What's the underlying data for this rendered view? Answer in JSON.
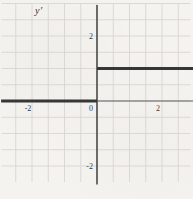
{
  "figure": {
    "axis_label": "y′",
    "description_visible_elements": "coordinate grid with x-axis, y-axis, and a thick step-function curve"
  },
  "colors": {
    "background": "#f5f3ef",
    "grid": "#d4d2ce",
    "axis": "#5f5f5f",
    "curve": "#363636",
    "tick_text": "#3a3a3a"
  },
  "chart_data": {
    "type": "line",
    "subtype": "step-function",
    "title": "",
    "xlabel": "",
    "ylabel": "y′",
    "xlim": [
      -3,
      3
    ],
    "ylim": [
      -2.5,
      3
    ],
    "grid": true,
    "grid_step": 0.5,
    "x_ticks": [
      {
        "value": -2,
        "label": "-2"
      },
      {
        "value": 0,
        "label": "0"
      },
      {
        "value": 2,
        "label": "2"
      }
    ],
    "y_ticks": [
      {
        "value": 2,
        "label": "2"
      },
      {
        "value": -2,
        "label": "-2"
      }
    ],
    "series": [
      {
        "name": "y-prime step function",
        "color": "#363636",
        "segments": [
          {
            "from": [
              -2.95,
              0
            ],
            "to": [
              0,
              0
            ]
          },
          {
            "from": [
              0,
              1
            ],
            "to": [
              2.96,
              1
            ]
          }
        ]
      }
    ]
  }
}
